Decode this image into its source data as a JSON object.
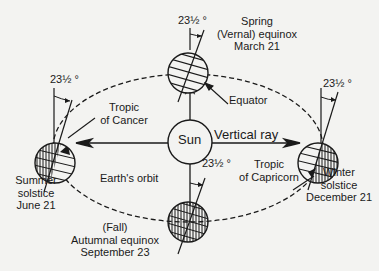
{
  "diagram": {
    "sun": {
      "label": "Sun"
    },
    "vertical_ray_label": "Vertical ray",
    "orbit_label": "Earth's orbit",
    "tilt_label": "23½ °",
    "positions": {
      "spring": {
        "line1": "Spring",
        "line2": "(Vernal) equinox",
        "line3": "March 21"
      },
      "summer": {
        "line1": "Summer",
        "line2": "solstice",
        "line3": "June 21"
      },
      "fall": {
        "line1": "(Fall)",
        "line2": "Autumnal  equinox",
        "line3": "September 23"
      },
      "winter": {
        "line1": "Winter",
        "line2": "solstice",
        "line3": "December 21"
      }
    },
    "callouts": {
      "equator": "Equator",
      "tropic_cancer_1": "Tropic",
      "tropic_cancer_2": "of Cancer",
      "tropic_capricorn_1": "Tropic",
      "tropic_capricorn_2": "of Capricorn"
    },
    "colors": {
      "ink": "#1a1a1a",
      "paper": "#f3f3f1"
    }
  }
}
